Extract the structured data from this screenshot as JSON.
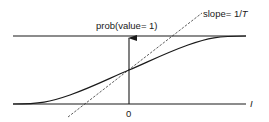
{
  "diagram": {
    "labels": {
      "probability": "prob(value= 1)",
      "slope_prefix": "slope= 1/",
      "slope_var": "T",
      "origin": "0",
      "x_axis": "I"
    },
    "colors": {
      "ink": "#1a1a1a",
      "background": "#ffffff"
    }
  }
}
